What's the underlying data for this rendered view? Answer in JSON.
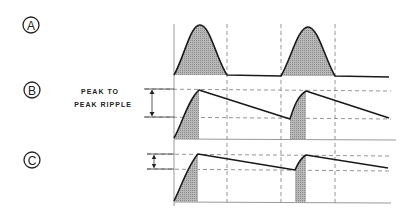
{
  "diagram": {
    "type": "rectifier-ripple-waveforms",
    "panels": [
      {
        "id": "A",
        "label": "A",
        "description": "Half-wave rectified pulses (no filtering)"
      },
      {
        "id": "B",
        "label": "B",
        "description": "Capacitor-filtered output with large peak-to-peak ripple"
      },
      {
        "id": "C",
        "label": "C",
        "description": "Capacitor-filtered output with smaller ripple"
      }
    ],
    "annotation": {
      "line1": "PEAK TO",
      "line2": "PEAK RIPPLE"
    },
    "colors": {
      "waveform": "#1a1a1a",
      "shading": "#a8a8a8",
      "axis": "#9a9a9a",
      "dashed": "#7a7a7a"
    }
  }
}
